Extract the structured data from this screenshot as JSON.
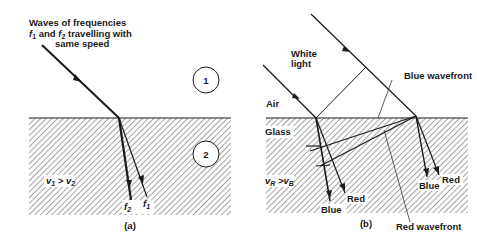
{
  "figure": {
    "panel_a": {
      "caption": "(a)",
      "incident_label_line1": "Waves of frequencies",
      "incident_label_line2_f": "f",
      "incident_label_line2_sub": "1",
      "incident_label_line2_mid": " and ",
      "incident_label_line2_f2": "f",
      "incident_label_line2_sub2": "2",
      "incident_label_line2_tail": " travelling with",
      "incident_label_line3": "same speed",
      "medium_1_label": "1",
      "medium_2_label": "2",
      "speed_relation": {
        "v": "v",
        "sub1": "1",
        "op": " > ",
        "v2": "v",
        "sub2": "2"
      },
      "ray_labels": {
        "f2": "f",
        "f2_sub": "2",
        "f1": "f",
        "f1_sub": "1"
      }
    },
    "panel_b": {
      "caption": "(b)",
      "white_light_line1": "White",
      "white_light_line2": "light",
      "air_label": "Air",
      "glass_label": "Glass",
      "speed_relation": {
        "v": "v",
        "subR": "R",
        "op": " >",
        "v2": "v",
        "subB": "B"
      },
      "blue_wavefront_label": "Blue wavefront",
      "red_wavefront_label": "Red wavefront",
      "left_rays": {
        "blue": "Blue",
        "red": "Red"
      },
      "right_rays": {
        "blue": "Blue",
        "red": "Red"
      }
    },
    "colors": {
      "ink": "#1a1a1a",
      "hatch": "#555555",
      "background": "#ffffff"
    }
  }
}
